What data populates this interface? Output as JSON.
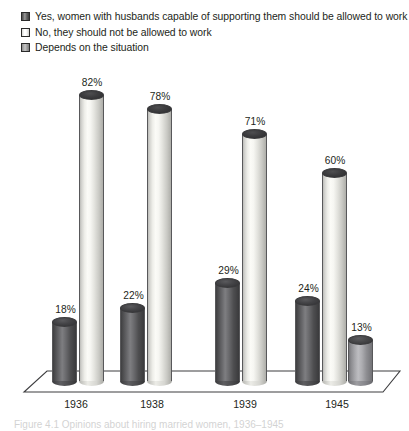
{
  "legend": {
    "items": [
      {
        "label": "Yes, women with husbands capable of supporting them should be allowed to work",
        "swatch": "dark-swatch-icon",
        "color": "#5a5a5d"
      },
      {
        "label": "No, they should not be allowed to work",
        "swatch": "white-swatch-icon",
        "color": "#f4f4f0"
      },
      {
        "label": "Depends on the situation",
        "swatch": "gray-swatch-icon",
        "color": "#a8a8ac"
      }
    ]
  },
  "caption": {
    "text": "Figure 4.1 Opinions about hiring married women, 1936–1945"
  },
  "chart_data": {
    "type": "bar",
    "title": "",
    "subtitle": "",
    "xlabel": "",
    "ylabel": "",
    "ylim": [
      0,
      100
    ],
    "grid": false,
    "legend_position": "top-left",
    "style": "3d-cylinder",
    "categories": [
      "1936",
      "1938",
      "1939",
      "1945"
    ],
    "series": [
      {
        "name": "Yes, women with husbands capable of supporting them should be allowed to work",
        "color": "#5a5a5d",
        "values": [
          18,
          22,
          29,
          24
        ],
        "labels": [
          "18%",
          "22%",
          "29%",
          "24%"
        ]
      },
      {
        "name": "No, they should not be allowed to work",
        "color": "#f4f4f0",
        "values": [
          82,
          78,
          71,
          60
        ],
        "labels": [
          "82%",
          "78%",
          "71%",
          "60%"
        ]
      },
      {
        "name": "Depends on the situation",
        "color": "#a8a8ac",
        "values": [
          null,
          null,
          null,
          13
        ],
        "labels": [
          "",
          "",
          "",
          "13%"
        ]
      }
    ]
  }
}
